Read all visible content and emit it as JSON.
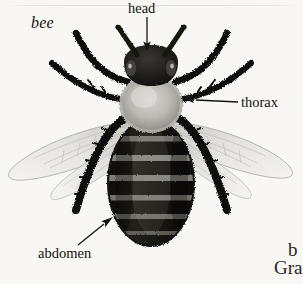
{
  "page": {
    "background_color": "#f8f7f4",
    "ink_color": "#141210",
    "width": 303,
    "height": 284
  },
  "figure": {
    "headword": "bee",
    "caption_note": "labeled anatomical illustration of a bee, dorsal view",
    "labels": [
      {
        "id": "head",
        "text": "head",
        "pointer": "arrow-down",
        "target": "bee head"
      },
      {
        "id": "thorax",
        "text": "thorax",
        "pointer": "arrow-left",
        "target": "bee thorax"
      },
      {
        "id": "abdomen",
        "text": "abdomen",
        "pointer": "arrow-up-right",
        "target": "bee abdomen"
      }
    ],
    "parts": {
      "head": {
        "name": "head",
        "color": "#1e1c1a",
        "eyes": 2,
        "antennae": 2
      },
      "thorax": {
        "name": "thorax",
        "color": "#b9b6b1",
        "texture": "fuzzy"
      },
      "abdomen": {
        "name": "abdomen",
        "color": "#17150f",
        "bands": 6,
        "band_color": "#8f8c85"
      },
      "wings": {
        "name": "wings",
        "count": 4,
        "color": "#d9d8d4"
      },
      "legs": {
        "name": "legs",
        "count": 6,
        "color": "#100f0d"
      }
    }
  },
  "column_bleed": {
    "line_1": "b",
    "line_2": "Gra"
  }
}
